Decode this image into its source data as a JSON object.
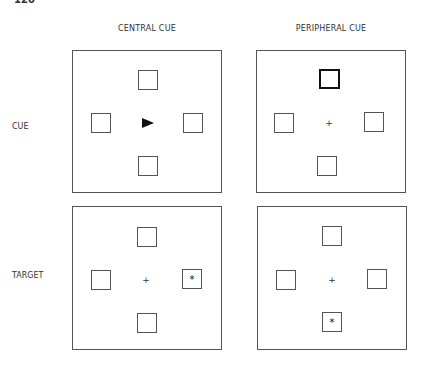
{
  "page": {
    "number": "120",
    "running_head": ""
  },
  "columns": [
    {
      "label": "CENTRAL CUE"
    },
    {
      "label": "PERIPHERAL CUE"
    }
  ],
  "rows": [
    {
      "label": "CUE"
    },
    {
      "label": "TARGET"
    }
  ],
  "panels": {
    "cue_central": {
      "center": "arrow-right",
      "highlighted_box": null,
      "target_box": null
    },
    "cue_peripheral": {
      "center": "+",
      "highlighted_box": "top",
      "target_box": null
    },
    "target_central": {
      "center": "+",
      "highlighted_box": null,
      "target_box": "right"
    },
    "target_peripheral": {
      "center": "+",
      "highlighted_box": null,
      "target_box": "bottom"
    }
  },
  "symbols": {
    "fixation": "+",
    "target": "*"
  }
}
